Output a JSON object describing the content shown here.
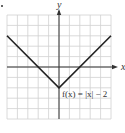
{
  "chart_data": {
    "type": "line",
    "title": "",
    "xlabel": "x",
    "ylabel": "y",
    "xlim": [
      -5,
      5
    ],
    "ylim": [
      -5,
      5
    ],
    "grid": true,
    "grid_step": 1,
    "series": [
      {
        "name": "f(x) = |x| − 2",
        "x": [
          -5,
          0,
          5
        ],
        "y": [
          3,
          -2,
          3
        ]
      }
    ],
    "annotations": [
      {
        "text": "f(x) = |x| − 2",
        "x": 0.3,
        "y": -2.6
      }
    ]
  },
  "labels": {
    "x_axis": "x",
    "y_axis": "y",
    "equation": "f(x) = |x| − 2"
  },
  "colors": {
    "grid": "#d0d0d0",
    "axes": "#333333",
    "curve": "#222222",
    "background": "#ffffff"
  }
}
